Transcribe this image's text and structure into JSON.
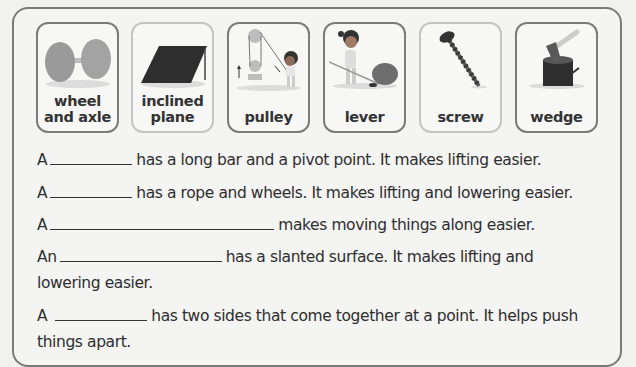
{
  "cards": [
    {
      "label_line1": "wheel",
      "label_line2": "and axle",
      "icon": "wheel-and-axle-icon",
      "border": "dark"
    },
    {
      "label_line1": "inclined",
      "label_line2": "plane",
      "icon": "inclined-plane-icon",
      "border": "light"
    },
    {
      "label_line1": "",
      "label_line2": "pulley",
      "icon": "pulley-icon",
      "border": "dark"
    },
    {
      "label_line1": "",
      "label_line2": "lever",
      "icon": "lever-icon",
      "border": "dark"
    },
    {
      "label_line1": "",
      "label_line2": "screw",
      "icon": "screw-icon",
      "border": "light"
    },
    {
      "label_line1": "",
      "label_line2": "wedge",
      "icon": "wedge-icon",
      "border": "dark"
    }
  ],
  "sentences": [
    {
      "prefix": "A",
      "blank_width": 82,
      "suffix": "has a long bar and a pivot point. It makes lifting easier.",
      "continuation": ""
    },
    {
      "prefix": "A",
      "blank_width": 82,
      "suffix": "has a rope and wheels. It makes lifting and lowering easier.",
      "continuation": ""
    },
    {
      "prefix": "A",
      "blank_width": 224,
      "suffix": "makes moving things along easier.",
      "continuation": ""
    },
    {
      "prefix": "An",
      "blank_width": 162,
      "suffix": "has a slanted surface. It makes lifting and",
      "continuation": "lowering easier."
    },
    {
      "prefix": "A",
      "blank_width": 92,
      "suffix": "has two sides that come together at a point. It helps push",
      "continuation": "things apart."
    }
  ],
  "colors": {
    "frame_border": "#7a7a7a",
    "card_border_dark": "#7b7b7b",
    "card_border_light": "#c4c4c4",
    "text": "#2e2e2e"
  }
}
